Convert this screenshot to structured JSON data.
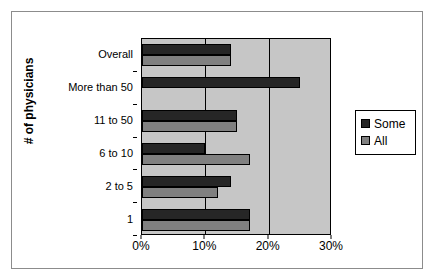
{
  "chart_data": {
    "type": "bar",
    "orientation": "horizontal",
    "title": "",
    "xlabel": "",
    "ylabel": "# of physicians",
    "xlim": [
      0,
      30
    ],
    "xtick_labels": [
      "0%",
      "10%",
      "20%",
      "30%"
    ],
    "xtick_values": [
      0,
      10,
      20,
      30
    ],
    "grid": true,
    "legend_position": "right",
    "categories": [
      "Overall",
      "More than 50",
      "11 to 50",
      "6 to 10",
      "2 to 5",
      "1"
    ],
    "series": [
      {
        "name": "Some",
        "color": "#262626",
        "values": [
          14,
          25,
          15,
          10,
          14,
          17
        ]
      },
      {
        "name": "All",
        "color": "#808080",
        "values": [
          14,
          0,
          15,
          17,
          12,
          17
        ]
      }
    ]
  },
  "legend": {
    "items": [
      {
        "label": "Some"
      },
      {
        "label": "All"
      }
    ]
  },
  "colors": {
    "plot_background": "#c6c6c6",
    "series_some": "#262626",
    "series_all": "#808080",
    "axis": "#000000",
    "frame": "#8c8c8c"
  }
}
